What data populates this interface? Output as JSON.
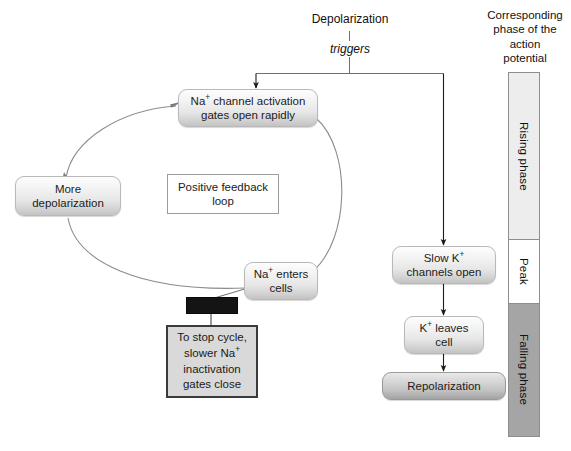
{
  "diagram": {
    "title_none": "",
    "trigger_label": "triggers",
    "nodes": {
      "depolarization": "Depolarization",
      "na_channel_activation": "Na<sup>+</sup> channel activation gates open rapidly",
      "na_channel_activation_line1": "Na<sup>+</sup> channel activation",
      "na_channel_activation_line2": "gates open rapidly",
      "more_depolarization_line1": "More",
      "more_depolarization_line2": "depolarization",
      "positive_feedback_line1": "Positive feedback",
      "positive_feedback_line2": "loop",
      "na_enters_cells_line1": "Na<sup>+</sup> enters",
      "na_enters_cells_line2": "cells",
      "redacted_label": "",
      "stop_cycle_line1": "To stop cycle,",
      "stop_cycle_line2": "slower Na<sup>+</sup>",
      "stop_cycle_line3": "inactivation",
      "stop_cycle_line4": "gates close",
      "slow_k_channels_line1": "Slow K<sup>+</sup>",
      "slow_k_channels_line2": "channels open",
      "k_leaves_cell_line1": "K<sup>+</sup> leaves",
      "k_leaves_cell_line2": "cell",
      "repolarization": "Repolarization"
    }
  },
  "phase_column": {
    "caption_line1": "Corresponding",
    "caption_line2": "phase of the",
    "caption_line3": "action",
    "caption_line4": "potential",
    "segments": [
      {
        "label": "Rising phase",
        "color": "#ededed"
      },
      {
        "label": "Peak",
        "color": "#ffffff"
      },
      {
        "label": "Falling phase",
        "color": "#a5a5a5"
      }
    ]
  },
  "colors": {
    "line": "#6e6e6e",
    "arrow": "#1a1a1a",
    "pill_border": "#b9b9b9",
    "heavy_border": "#3a3a3a",
    "redacted": "#141414"
  }
}
